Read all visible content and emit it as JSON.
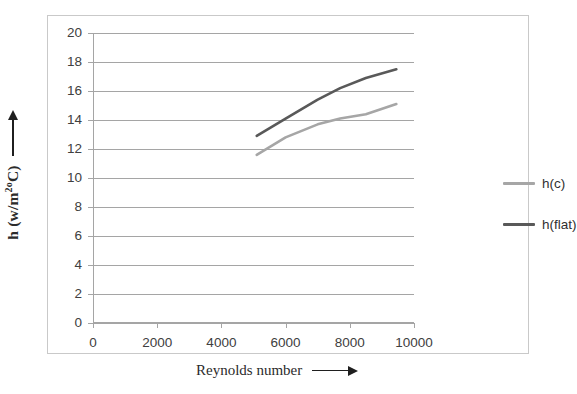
{
  "chart_data": {
    "type": "line",
    "title": "",
    "xlabel": "Reynolds number",
    "ylabel": "h (w/m2oC)",
    "xlim": [
      0,
      10000
    ],
    "ylim": [
      0,
      20
    ],
    "grid": true,
    "legend_position": "right",
    "x_ticks": [
      "0",
      "2000",
      "4000",
      "6000",
      "8000",
      "10000"
    ],
    "y_ticks": [
      "0",
      "2",
      "4",
      "6",
      "8",
      "10",
      "12",
      "14",
      "16",
      "18",
      "20"
    ],
    "series": [
      {
        "name": "h(c)",
        "color": "#a6a6a6",
        "x": [
          5100,
          6000,
          7000,
          7700,
          8500,
          9450
        ],
        "values": [
          11.6,
          12.8,
          13.7,
          14.1,
          14.4,
          15.1
        ]
      },
      {
        "name": "h(flat)",
        "color": "#595959",
        "x": [
          5100,
          6000,
          7000,
          7700,
          8500,
          9450
        ],
        "values": [
          12.9,
          14.1,
          15.4,
          16.2,
          16.9,
          17.5
        ]
      }
    ]
  },
  "axes": {
    "y_title_main": "h  (w/m",
    "y_title_sup": "2o",
    "y_title_tail": "C)",
    "x_title": "Reynolds number"
  },
  "legend": {
    "entries": [
      {
        "label": "h(c)",
        "color": "#a6a6a6"
      },
      {
        "label": "h(flat)",
        "color": "#595959"
      }
    ]
  },
  "colors": {
    "series_light": "#a6a6a6",
    "series_dark": "#595959",
    "gridline": "#a5a5a5",
    "frame": "#c9c9c9",
    "text": "#404040"
  }
}
